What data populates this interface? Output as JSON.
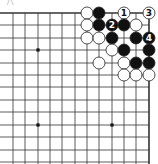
{
  "diagram": {
    "type": "go-board-fragment",
    "corner_label": "ハ",
    "grid": {
      "columns_x": [
        1,
        13,
        25,
        38,
        50,
        62,
        75,
        87,
        99,
        112,
        124,
        136,
        149
      ],
      "rows_y": [
        13,
        25,
        38,
        50,
        63,
        75,
        87,
        100,
        112,
        125,
        137,
        150,
        162
      ],
      "top_edge_y": 13,
      "right_edge_x": 149,
      "line_color": "#333333",
      "edge_width": 1.6,
      "line_width": 0.8
    },
    "star_points": [
      {
        "x": 38,
        "y": 50
      },
      {
        "x": 38,
        "y": 125
      },
      {
        "x": 112,
        "y": 125
      }
    ],
    "stones": [
      {
        "x": 87,
        "y": 13,
        "color": "white"
      },
      {
        "x": 99,
        "y": 13,
        "color": "black"
      },
      {
        "x": 124,
        "y": 13,
        "color": "white",
        "label": "1"
      },
      {
        "x": 149,
        "y": 13,
        "color": "white",
        "label": "3"
      },
      {
        "x": 87,
        "y": 25,
        "color": "white"
      },
      {
        "x": 99,
        "y": 25,
        "color": "black"
      },
      {
        "x": 112,
        "y": 25,
        "color": "black",
        "label": "2"
      },
      {
        "x": 124,
        "y": 25,
        "color": "black"
      },
      {
        "x": 136,
        "y": 25,
        "color": "white"
      },
      {
        "x": 87,
        "y": 38,
        "color": "white"
      },
      {
        "x": 99,
        "y": 38,
        "color": "white"
      },
      {
        "x": 112,
        "y": 38,
        "color": "black"
      },
      {
        "x": 136,
        "y": 38,
        "color": "black"
      },
      {
        "x": 149,
        "y": 38,
        "color": "black",
        "label": "4"
      },
      {
        "x": 112,
        "y": 50,
        "color": "white"
      },
      {
        "x": 124,
        "y": 50,
        "color": "black"
      },
      {
        "x": 149,
        "y": 50,
        "color": "black"
      },
      {
        "x": 99,
        "y": 63,
        "color": "white"
      },
      {
        "x": 124,
        "y": 63,
        "color": "white"
      },
      {
        "x": 136,
        "y": 63,
        "color": "black"
      },
      {
        "x": 149,
        "y": 63,
        "color": "black"
      },
      {
        "x": 124,
        "y": 75,
        "color": "white"
      },
      {
        "x": 136,
        "y": 75,
        "color": "white"
      },
      {
        "x": 149,
        "y": 75,
        "color": "white"
      }
    ],
    "colors": {
      "black_stone": "#111111",
      "white_stone": "#ffffff",
      "stone_outline": "#222222",
      "label_on_black": "#ffffff",
      "label_on_white": "#111111"
    }
  }
}
